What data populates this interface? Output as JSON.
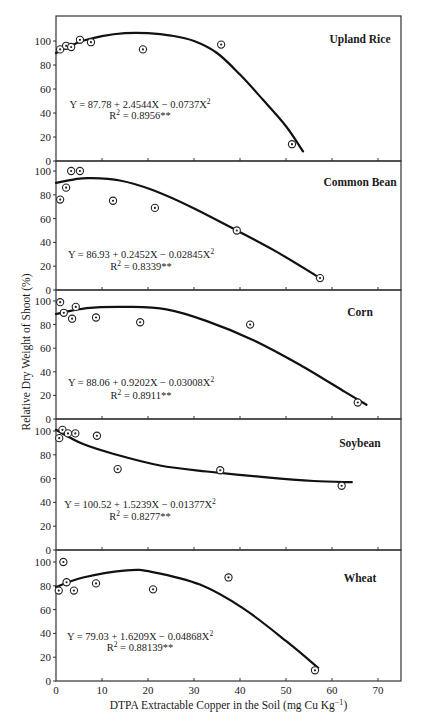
{
  "figure": {
    "ylabel": "Relative Dry Weight of Shoot (%)",
    "xlabel_main": "DTPA Extractable Copper in the Soil (mg Cu Kg",
    "xlabel_sup": "−1",
    "xlabel_close": ")"
  },
  "chart_data": [
    {
      "type": "scatter",
      "title": "Upland Rice",
      "equation": "Y = 87.78 + 2.4544X − 0.0737X",
      "equation_sup": "2",
      "r2_label": "R",
      "r2_sup": "2",
      "r2_value": " = 0.8956**",
      "xlabel": "DTPA Extractable Copper in the Soil (mg Cu Kg−1)",
      "ylabel": "Relative Dry Weight of Shoot (%)",
      "xlim": [
        0,
        75
      ],
      "ylim": [
        0,
        121
      ],
      "xticks": [
        0,
        10,
        20,
        30,
        40,
        50,
        60,
        70
      ],
      "yticks": [
        0,
        20,
        40,
        60,
        80,
        100
      ],
      "points": [
        [
          0.9,
          93
        ],
        [
          2.2,
          96
        ],
        [
          3.3,
          95
        ],
        [
          5.2,
          101
        ],
        [
          7.6,
          99
        ],
        [
          18.9,
          93
        ],
        [
          35.9,
          97
        ],
        [
          51.3,
          14
        ]
      ],
      "fit_curve": [
        [
          0,
          90
        ],
        [
          5,
          99
        ],
        [
          10,
          104
        ],
        [
          15,
          106.5
        ],
        [
          20,
          106.5
        ],
        [
          25,
          104.5
        ],
        [
          30,
          100
        ],
        [
          35,
          90
        ],
        [
          40,
          72
        ],
        [
          45,
          51
        ],
        [
          50,
          29
        ],
        [
          53.7,
          8
        ]
      ]
    },
    {
      "type": "scatter",
      "title": "Common Bean",
      "equation": "Y = 86.93 + 0.2452X − 0.02845X",
      "equation_sup": "2",
      "r2_label": "R",
      "r2_sup": "2",
      "r2_value": " = 0.8339**",
      "xlim": [
        0,
        75
      ],
      "ylim": [
        0,
        108
      ],
      "xticks": [
        0,
        10,
        20,
        30,
        40,
        50,
        60,
        70
      ],
      "yticks": [
        0,
        20,
        40,
        60,
        80,
        100
      ],
      "points": [
        [
          0.9,
          76
        ],
        [
          2.2,
          86
        ],
        [
          3.3,
          100
        ],
        [
          5.2,
          100
        ],
        [
          12.4,
          75
        ],
        [
          21.5,
          69
        ],
        [
          39.3,
          50
        ],
        [
          57.4,
          10
        ]
      ],
      "fit_curve": [
        [
          0,
          90
        ],
        [
          4,
          93
        ],
        [
          7.4,
          94
        ],
        [
          13.9,
          92
        ],
        [
          21,
          84
        ],
        [
          29.8,
          69
        ],
        [
          39.3,
          50
        ],
        [
          48,
          32
        ],
        [
          57,
          11
        ]
      ]
    },
    {
      "type": "scatter",
      "title": "Corn",
      "equation": "Y = 88.06 + 0.9202X − 0.03008X",
      "equation_sup": "2",
      "r2_label": "R",
      "r2_sup": "2",
      "r2_value": " = 0.8911**",
      "xlim": [
        0,
        75
      ],
      "ylim": [
        0,
        109
      ],
      "xticks": [
        0,
        10,
        20,
        30,
        40,
        50,
        60,
        70
      ],
      "yticks": [
        0,
        20,
        40,
        60,
        80,
        100
      ],
      "points": [
        [
          0.9,
          99
        ],
        [
          1.7,
          90
        ],
        [
          3.5,
          85
        ],
        [
          4.3,
          95
        ],
        [
          8.7,
          86
        ],
        [
          18.3,
          82
        ],
        [
          42.2,
          80
        ],
        [
          65.6,
          14
        ]
      ],
      "fit_curve": [
        [
          0,
          89
        ],
        [
          6.7,
          94
        ],
        [
          15.4,
          95
        ],
        [
          24,
          93
        ],
        [
          32.8,
          83
        ],
        [
          42.8,
          67
        ],
        [
          53,
          46
        ],
        [
          62.8,
          23
        ],
        [
          67.5,
          12
        ]
      ]
    },
    {
      "type": "scatter",
      "title": "Soybean",
      "equation": "Y = 100.52 + 1.5239X − 0.01377X",
      "equation_sup": "2",
      "r2_label": "R",
      "r2_sup": "2",
      "r2_value": " = 0.8277**",
      "xlim": [
        0,
        75
      ],
      "ylim": [
        0,
        110
      ],
      "xticks": [
        0,
        10,
        20,
        30,
        40,
        50,
        60,
        70
      ],
      "yticks": [
        0,
        20,
        40,
        60,
        80,
        100
      ],
      "points": [
        [
          0.7,
          94
        ],
        [
          1.4,
          101
        ],
        [
          2.6,
          98
        ],
        [
          4.2,
          98
        ],
        [
          8.9,
          96
        ],
        [
          13.4,
          68
        ],
        [
          35.7,
          67
        ],
        [
          62.1,
          54
        ]
      ],
      "fit_curve": [
        [
          0,
          101
        ],
        [
          5.9,
          89
        ],
        [
          13.2,
          80
        ],
        [
          22.6,
          71
        ],
        [
          32.8,
          66
        ],
        [
          45.8,
          61
        ],
        [
          56,
          58
        ],
        [
          64.3,
          57
        ]
      ]
    },
    {
      "type": "scatter",
      "title": "Wheat",
      "equation": "Y = 79.03 + 1.6209X − 0.04868X",
      "equation_sup": "2",
      "r2_label": "R",
      "r2_sup": "2",
      "r2_value": " = 0.88139**",
      "xlim": [
        0,
        75
      ],
      "ylim": [
        0,
        110
      ],
      "xticks": [
        0,
        10,
        20,
        30,
        40,
        50,
        60,
        70
      ],
      "yticks": [
        0,
        20,
        40,
        60,
        80,
        100
      ],
      "points": [
        [
          0.6,
          76
        ],
        [
          1.6,
          100
        ],
        [
          2.3,
          83
        ],
        [
          3.9,
          76
        ],
        [
          8.7,
          82
        ],
        [
          21.1,
          77
        ],
        [
          37.5,
          87
        ],
        [
          56.3,
          9
        ]
      ],
      "fit_curve": [
        [
          0,
          79
        ],
        [
          5.9,
          87
        ],
        [
          15.4,
          93
        ],
        [
          21,
          91.5
        ],
        [
          31.3,
          81
        ],
        [
          40.7,
          61
        ],
        [
          50.2,
          33
        ],
        [
          57,
          11
        ]
      ]
    }
  ],
  "layout": {
    "plot_left": 56,
    "plot_right": 401,
    "panels": [
      {
        "top": 16,
        "zero": 161,
        "hundred": 41,
        "eq_y": 108,
        "r2_y": 119,
        "eq_x": 140,
        "crop_y": 43
      },
      {
        "top": 161,
        "zero": 290,
        "hundred": 171,
        "eq_y": 258,
        "r2_y": 270,
        "eq_x": 141,
        "crop_y": 186
      },
      {
        "top": 290,
        "zero": 419,
        "hundred": 301,
        "eq_y": 386,
        "r2_y": 399,
        "eq_x": 141,
        "crop_y": 316
      },
      {
        "top": 419,
        "zero": 550,
        "hundred": 431,
        "eq_y": 508,
        "r2_y": 520,
        "eq_x": 140,
        "crop_y": 447
      },
      {
        "top": 550,
        "zero": 681,
        "hundred": 562,
        "eq_y": 640,
        "r2_y": 651,
        "eq_x": 140,
        "crop_y": 582
      }
    ],
    "crop_x": 360
  }
}
